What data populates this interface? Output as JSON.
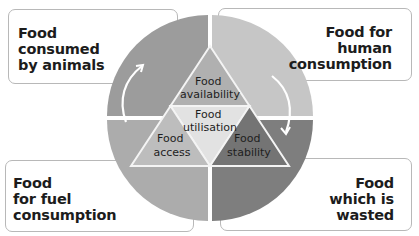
{
  "diagram": {
    "colors": {
      "quadrant_top_left": "#9c9c9c",
      "quadrant_top_right": "#c6c6c6",
      "quadrant_bottom_left": "#acacac",
      "quadrant_bottom_right": "#7e7e7e",
      "triangle_availability": "#b0b0b0",
      "triangle_utilisation": "#e2e2e2",
      "triangle_access": "#bdbdbd",
      "triangle_stability": "#747474",
      "box_border": "#b8b8b8"
    },
    "corner_boxes": {
      "top_left": {
        "lines": [
          "Food",
          "consumed",
          "by animals"
        ]
      },
      "top_right": {
        "lines": [
          "Food for",
          "human",
          "consumption"
        ]
      },
      "bottom_left": {
        "lines": [
          "Food",
          "for fuel",
          "consumption"
        ]
      },
      "bottom_right": {
        "lines": [
          "Food",
          "which is",
          "wasted"
        ]
      }
    },
    "triangle": {
      "availability": [
        "Food",
        "availability"
      ],
      "utilisation": [
        "Food",
        "utilisation"
      ],
      "access": [
        "Food",
        "access"
      ],
      "stability": [
        "Food",
        "stability"
      ]
    }
  }
}
